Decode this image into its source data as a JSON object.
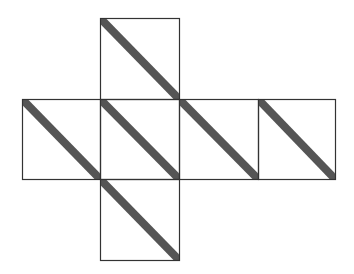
{
  "diagram": {
    "stroke_color": "#333333",
    "stripe_color": "#555555",
    "background": "#ffffff",
    "faces": [
      {
        "id": "top",
        "x": 100,
        "y": 18,
        "w": 79,
        "h": 81,
        "stripe": "top-left to bottom-right"
      },
      {
        "id": "left",
        "x": 22,
        "y": 99,
        "w": 78,
        "h": 80,
        "stripe": "top-left to bottom-right"
      },
      {
        "id": "center",
        "x": 100,
        "y": 99,
        "w": 79,
        "h": 80,
        "stripe": "top-left to bottom-right"
      },
      {
        "id": "right",
        "x": 179,
        "y": 99,
        "w": 79,
        "h": 80,
        "stripe": "top-left to bottom-right"
      },
      {
        "id": "far-right",
        "x": 258,
        "y": 99,
        "w": 77,
        "h": 80,
        "stripe": "top-left to bottom-right"
      },
      {
        "id": "bottom",
        "x": 100,
        "y": 179,
        "w": 79,
        "h": 81,
        "stripe": "top-left to bottom-right"
      }
    ]
  }
}
